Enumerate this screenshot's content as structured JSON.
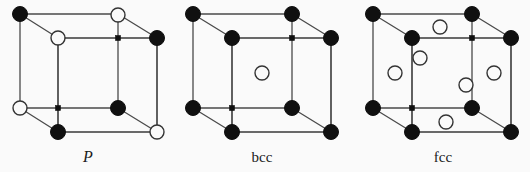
{
  "figure": {
    "background_color": "#fafafa",
    "line_color": "#3a3a3a",
    "filled_node_color": "#101010",
    "open_node_fill": "#fafafa",
    "open_node_stroke": "#333333",
    "width": 530,
    "height": 172
  },
  "cells": [
    {
      "id": "p",
      "label": "P",
      "label_style": "italic",
      "label_x": 88,
      "label_y": 162,
      "description": "primitive cubic unit cell",
      "geometry": {
        "front": {
          "left": 58,
          "right": 157,
          "top": 38,
          "bottom": 132
        },
        "back": {
          "left": 20,
          "right": 118,
          "top": 14,
          "bottom": 108
        }
      },
      "nodes": [
        {
          "name": "back-top-left",
          "x": 20,
          "y": 14,
          "type": "filled",
          "r": 7.5
        },
        {
          "name": "back-top-right",
          "x": 118,
          "y": 15,
          "type": "open",
          "r": 7
        },
        {
          "name": "back-bottom-left",
          "x": 20,
          "y": 108,
          "type": "open",
          "r": 7
        },
        {
          "name": "back-bottom-right",
          "x": 118,
          "y": 108,
          "type": "filled",
          "r": 7.5
        },
        {
          "name": "front-top-left",
          "x": 58,
          "y": 38,
          "type": "open",
          "r": 7
        },
        {
          "name": "front-top-right",
          "x": 157,
          "y": 38,
          "type": "filled",
          "r": 7.5
        },
        {
          "name": "front-bottom-left",
          "x": 58,
          "y": 132,
          "type": "filled",
          "r": 7.5
        },
        {
          "name": "front-bottom-right",
          "x": 157,
          "y": 132,
          "type": "open",
          "r": 7
        },
        {
          "name": "hidden-vertex-marker-top",
          "x": 118,
          "y": 38,
          "type": "small",
          "r": 2.6
        },
        {
          "name": "hidden-vertex-marker-bottom",
          "x": 58,
          "y": 108,
          "type": "small",
          "r": 2.6
        }
      ]
    },
    {
      "id": "bcc",
      "label": "bcc",
      "label_style": "upright",
      "label_x": 262,
      "label_y": 162,
      "description": "body-centred cubic unit cell",
      "geometry": {
        "front": {
          "left": 232,
          "right": 331,
          "top": 38,
          "bottom": 132
        },
        "back": {
          "left": 193,
          "right": 292,
          "top": 14,
          "bottom": 108
        }
      },
      "nodes": [
        {
          "name": "back-top-left",
          "x": 193,
          "y": 14,
          "type": "filled",
          "r": 7.5
        },
        {
          "name": "back-top-right",
          "x": 292,
          "y": 14,
          "type": "filled",
          "r": 7.5
        },
        {
          "name": "back-bottom-left",
          "x": 193,
          "y": 108,
          "type": "filled",
          "r": 7.5
        },
        {
          "name": "back-bottom-right",
          "x": 292,
          "y": 108,
          "type": "filled",
          "r": 7.5
        },
        {
          "name": "front-top-left",
          "x": 232,
          "y": 38,
          "type": "filled",
          "r": 7.5
        },
        {
          "name": "front-top-right",
          "x": 331,
          "y": 38,
          "type": "filled",
          "r": 7.5
        },
        {
          "name": "front-bottom-left",
          "x": 232,
          "y": 132,
          "type": "filled",
          "r": 7.5
        },
        {
          "name": "front-bottom-right",
          "x": 331,
          "y": 132,
          "type": "filled",
          "r": 7.5
        },
        {
          "name": "body-centre",
          "x": 262,
          "y": 73,
          "type": "open",
          "r": 7
        },
        {
          "name": "hidden-vertex-marker-top",
          "x": 292,
          "y": 38,
          "type": "small",
          "r": 2.6
        },
        {
          "name": "hidden-vertex-marker-bottom",
          "x": 232,
          "y": 108,
          "type": "small",
          "r": 2.6
        }
      ]
    },
    {
      "id": "fcc",
      "label": "fcc",
      "label_style": "upright",
      "label_x": 443,
      "label_y": 162,
      "description": "face-centred cubic unit cell",
      "geometry": {
        "front": {
          "left": 412,
          "right": 511,
          "top": 38,
          "bottom": 132
        },
        "back": {
          "left": 373,
          "right": 472,
          "top": 14,
          "bottom": 108
        }
      },
      "nodes": [
        {
          "name": "back-top-left",
          "x": 373,
          "y": 14,
          "type": "filled",
          "r": 7.5
        },
        {
          "name": "back-top-right",
          "x": 472,
          "y": 14,
          "type": "filled",
          "r": 7.5
        },
        {
          "name": "back-bottom-left",
          "x": 373,
          "y": 108,
          "type": "filled",
          "r": 7.5
        },
        {
          "name": "back-bottom-right",
          "x": 472,
          "y": 108,
          "type": "filled",
          "r": 7.5
        },
        {
          "name": "front-top-left",
          "x": 412,
          "y": 38,
          "type": "filled",
          "r": 7.5
        },
        {
          "name": "front-top-right",
          "x": 511,
          "y": 38,
          "type": "filled",
          "r": 7.5
        },
        {
          "name": "front-bottom-left",
          "x": 412,
          "y": 132,
          "type": "filled",
          "r": 7.5
        },
        {
          "name": "front-bottom-right",
          "x": 511,
          "y": 132,
          "type": "filled",
          "r": 7.5
        },
        {
          "name": "face-centre-top",
          "x": 440,
          "y": 27,
          "type": "open",
          "r": 7
        },
        {
          "name": "face-centre-bottom",
          "x": 446,
          "y": 122,
          "type": "open",
          "r": 7
        },
        {
          "name": "face-centre-left",
          "x": 395,
          "y": 73,
          "type": "open",
          "r": 7
        },
        {
          "name": "face-centre-right",
          "x": 494,
          "y": 73,
          "type": "open",
          "r": 7
        },
        {
          "name": "face-centre-back",
          "x": 420,
          "y": 58,
          "type": "open",
          "r": 7
        },
        {
          "name": "face-centre-front",
          "x": 466,
          "y": 85,
          "type": "open",
          "r": 7
        },
        {
          "name": "hidden-vertex-marker-top",
          "x": 472,
          "y": 38,
          "type": "small",
          "r": 2.6
        },
        {
          "name": "hidden-vertex-marker-bottom",
          "x": 412,
          "y": 108,
          "type": "small",
          "r": 2.6
        }
      ]
    }
  ]
}
